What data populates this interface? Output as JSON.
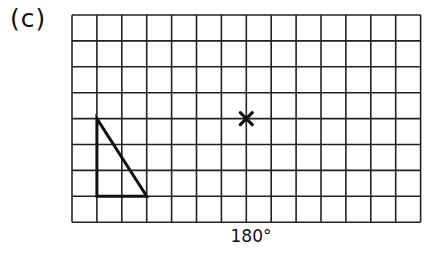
{
  "figure": {
    "part_label": "(c)",
    "rotation_label": "180°",
    "grid": {
      "columns": 14,
      "rows": 8,
      "left": 72,
      "top": 15,
      "cell_width": 24.9,
      "cell_height": 25.9,
      "line_color": "#222222"
    },
    "shape": {
      "type": "right-triangle",
      "vertices_grid": [
        [
          1,
          4
        ],
        [
          1,
          7
        ],
        [
          3,
          7
        ]
      ],
      "stroke_color": "#111111"
    },
    "center_of_rotation": {
      "marker": "cross",
      "grid_point": [
        7,
        4
      ]
    }
  }
}
